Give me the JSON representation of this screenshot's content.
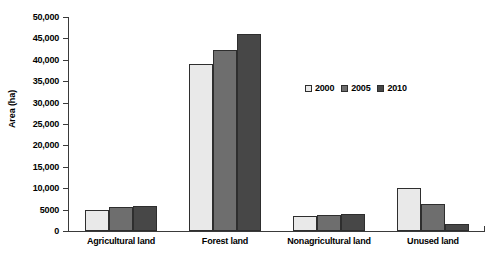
{
  "chart_data": {
    "type": "bar",
    "title": "",
    "xlabel": "",
    "ylabel": "Area (ha)",
    "categories": [
      "Agricultural land",
      "Forest land",
      "Nonagricultural land",
      "Unused land"
    ],
    "series": [
      {
        "name": "2000",
        "color": "#e9e9e9",
        "values": [
          5000,
          39000,
          3500,
          10000
        ]
      },
      {
        "name": "2005",
        "color": "#6e6e6e",
        "values": [
          5500,
          42300,
          3700,
          6200
        ]
      },
      {
        "name": "2010",
        "color": "#474747",
        "values": [
          5800,
          46100,
          3900,
          1550
        ]
      }
    ],
    "ylim": [
      0,
      50000
    ],
    "ytick_values": [
      0,
      5000,
      10000,
      15000,
      20000,
      25000,
      30000,
      35000,
      40000,
      45000,
      50000
    ],
    "ytick_labels": [
      "0",
      "5000",
      "10,000",
      "15,000",
      "20,000",
      "25,000",
      "30,000",
      "35,000",
      "40,000",
      "45,000",
      "50,000"
    ],
    "grid": false,
    "legend_position": "center-right-inside",
    "bar_border_color": "#2e2e2e",
    "axis_color": "#3a3a3a"
  }
}
